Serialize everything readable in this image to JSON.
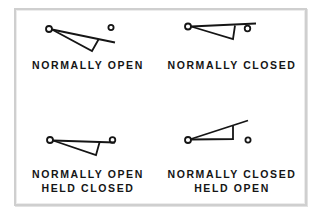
{
  "diagram": {
    "colors": {
      "ink": "#151515",
      "frame": "#cfcfcf",
      "background": "#ffffff"
    },
    "symbols": [
      {
        "id": "normally-open",
        "label_lines": [
          "NORMALLY OPEN"
        ],
        "state": "open"
      },
      {
        "id": "normally-closed",
        "label_lines": [
          "NORMALLY CLOSED"
        ],
        "state": "closed"
      },
      {
        "id": "normally-open-held-closed",
        "label_lines": [
          "NORMALLY OPEN",
          "HELD CLOSED"
        ],
        "state": "closed"
      },
      {
        "id": "normally-closed-held-open",
        "label_lines": [
          "NORMALLY CLOSED",
          "HELD OPEN"
        ],
        "state": "open"
      }
    ]
  }
}
